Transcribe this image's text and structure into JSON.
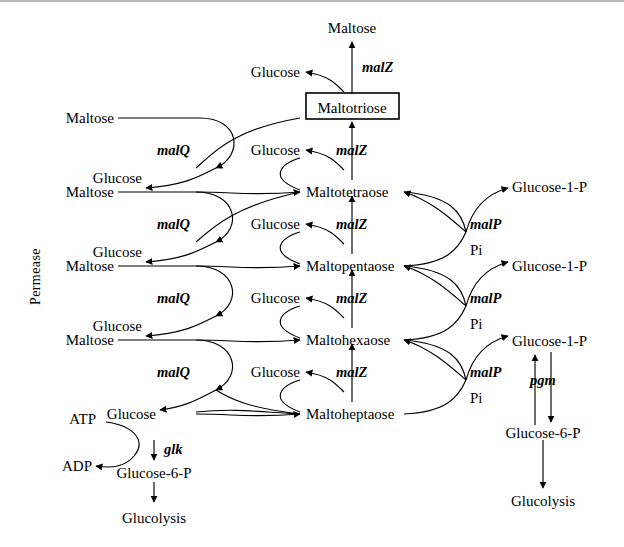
{
  "diagram": {
    "background": "#ffffff",
    "stroke_color": "#000000",
    "boxed_node": "Maltotriose"
  },
  "nodes": {
    "top_maltose": "Maltose",
    "boxed": "Maltotriose",
    "chain": [
      "Maltotetraose",
      "Maltopentaose",
      "Maltohexaose",
      "Maltoheptaose"
    ],
    "glucose": "Glucose",
    "maltose": "Maltose",
    "glucose_1_p": "Glucose-1-P",
    "glucose_6_p": "Glucose-6-P",
    "glucolysis": "Glucolysis",
    "atp": "ATP",
    "adp": "ADP",
    "pi": "Pi"
  },
  "enzymes": {
    "malQ": "malQ",
    "malZ": "malZ",
    "malP": "malP",
    "pgm": "pgm",
    "glk": "glk"
  },
  "labels": {
    "permease": "Permease"
  },
  "rows": {
    "maltose_entries": [
      "Maltose",
      "Maltose",
      "Maltose",
      "Maltose"
    ],
    "glucose_left_outputs": [
      "Glucose",
      "Glucose",
      "Glucose",
      "Glucose"
    ],
    "glucose_center_outputs": [
      "Glucose",
      "Glucose",
      "Glucose",
      "Glucose"
    ],
    "malQ_labels": [
      "malQ",
      "malQ",
      "malQ",
      "malQ"
    ],
    "malZ_labels": [
      "malZ",
      "malZ",
      "malZ",
      "malZ",
      "malZ"
    ],
    "malP_labels": [
      "malP",
      "malP",
      "malP"
    ],
    "pi_labels": [
      "Pi",
      "Pi",
      "Pi"
    ],
    "glucose_1_p_labels": [
      "Glucose-1-P",
      "Glucose-1-P",
      "Glucose-1-P"
    ]
  }
}
